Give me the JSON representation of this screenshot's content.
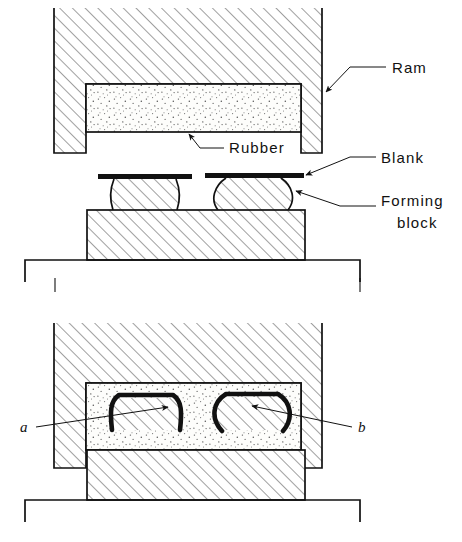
{
  "figure": {
    "background_color": "#ffffff",
    "line_color": "#111111",
    "panels": [
      {
        "id": "upper",
        "name": "before-forming",
        "description": "Ram with rubber pad raised above blanks resting on forming blocks"
      },
      {
        "id": "lower",
        "name": "after-forming",
        "description": "Ram lowered, rubber pad wraps blanks around forming blocks"
      }
    ]
  },
  "labels": {
    "ram": "Ram",
    "rubber": "Rubber",
    "blank": "Blank",
    "forming_block_line1": "Forming",
    "forming_block_line2": "block",
    "part_a": "a",
    "part_b": "b"
  },
  "colors": {
    "ink": "#111111",
    "paper": "#ffffff",
    "blank_metal": "#111111",
    "hatch_stroke": "#555555",
    "stipple_dot": "#5a5a5a"
  },
  "geometry": {
    "upper": {
      "ram_outer": {
        "x": 54,
        "y": 8,
        "width": 268,
        "height": 145
      },
      "rubber_pad": {
        "x": 86,
        "y": 84,
        "width": 215,
        "height": 48
      },
      "blank_left": {
        "x": 98,
        "y": 174,
        "width": 92,
        "height": 5
      },
      "blank_right": {
        "x": 205,
        "y": 173,
        "width": 97,
        "height": 5
      },
      "forming_block_left": {
        "x": 112,
        "y": 179,
        "width": 66,
        "height": 31,
        "side_profile": "concave"
      },
      "forming_block_right": {
        "x": 218,
        "y": 178,
        "width": 72,
        "height": 32,
        "side_profile": "convex"
      },
      "die_block": {
        "x": 87,
        "y": 210,
        "width": 218,
        "height": 50
      },
      "base_plate": {
        "x": 25,
        "y": 260,
        "width": 335,
        "height": 22
      }
    },
    "lower": {
      "ram_outer": {
        "x": 54,
        "y": 323,
        "width": 268,
        "height": 145
      },
      "rubber_pad": {
        "x": 86,
        "y": 383,
        "width": 215,
        "height": 67
      },
      "die_block": {
        "x": 87,
        "y": 450,
        "width": 218,
        "height": 50
      },
      "base_plate": {
        "x": 25,
        "y": 500,
        "width": 335,
        "height": 22
      },
      "formed_part_a": {
        "x": 112,
        "y": 392,
        "width": 70,
        "height": 38
      },
      "formed_part_b": {
        "x": 218,
        "y": 392,
        "width": 74,
        "height": 38
      }
    }
  },
  "leaders": [
    {
      "name": "ram-leader",
      "label": "Ram",
      "from": [
        390,
        68
      ],
      "to": [
        325,
        95
      ],
      "arrow": true
    },
    {
      "name": "rubber-leader",
      "label": "Rubber",
      "from": [
        240,
        148
      ],
      "to": [
        190,
        133
      ],
      "arrow": true
    },
    {
      "name": "blank-leader",
      "label": "Blank",
      "from": [
        370,
        158
      ],
      "to": [
        302,
        176
      ],
      "arrow": true
    },
    {
      "name": "forming-block-leader",
      "label": "Forming block",
      "from": [
        370,
        205
      ],
      "to": [
        300,
        190
      ],
      "arrow": true
    },
    {
      "name": "part-a-leader",
      "label": "a",
      "from": [
        33,
        424
      ],
      "to": [
        165,
        408
      ],
      "arrow": true
    },
    {
      "name": "part-b-leader",
      "label": "b",
      "from": [
        355,
        424
      ],
      "to": [
        248,
        407
      ],
      "arrow": true
    }
  ]
}
